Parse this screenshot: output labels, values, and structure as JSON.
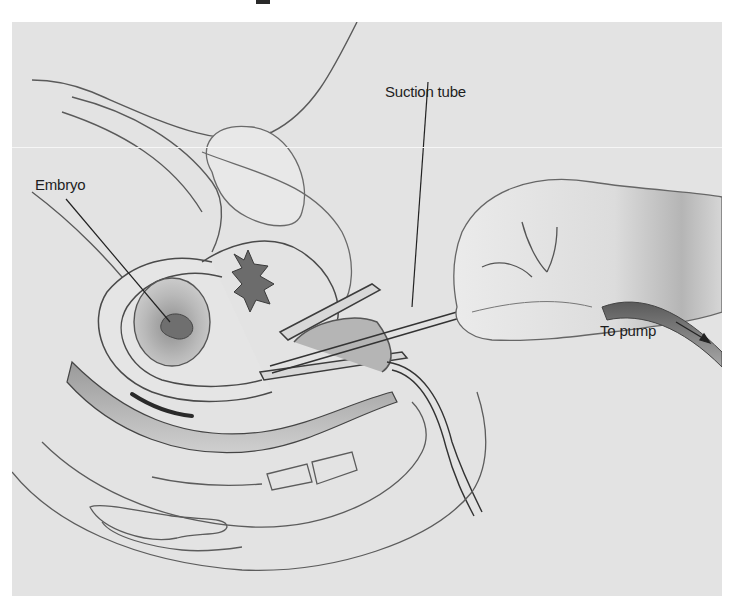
{
  "figure": {
    "background_color": "#e3e3e3",
    "line_color": "#3a3a3a",
    "labels": {
      "suction_tube": "Suction tube",
      "embryo": "Embryo",
      "to_pump": "To pump"
    },
    "icons": {
      "pump_arrow": "arrow-down-right"
    }
  }
}
